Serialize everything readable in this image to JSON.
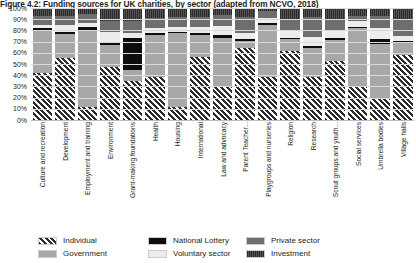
{
  "figure": {
    "title": "Figure 4.2: Funding sources for UK charities, by sector (adapted from NCVO, 2018)"
  },
  "legend": {
    "items": [
      {
        "label": "Individual",
        "key": "individual",
        "color": "#2b2b2b",
        "swatch": "hatch-diagonal"
      },
      {
        "label": "Government",
        "key": "government",
        "color": "#a8a8a8",
        "swatch": "solid"
      },
      {
        "label": "National Lottery",
        "key": "lottery",
        "color": "#0d0d0d",
        "swatch": "solid"
      },
      {
        "label": "Voluntary sector",
        "key": "voluntary",
        "color": "#ececec",
        "swatch": "solid"
      },
      {
        "label": "Private sector",
        "key": "private",
        "color": "#6e6e6e",
        "swatch": "solid"
      },
      {
        "label": "Investment",
        "key": "investment",
        "color": "#3f3f3f",
        "swatch": "texture-vertical"
      }
    ]
  },
  "chart_data": {
    "type": "bar",
    "subtype": "stacked-100-percent",
    "title": "Figure 4.2: Funding sources for UK charities, by sector (adapted from NCVO, 2018)",
    "xlabel": "",
    "ylabel": "",
    "ylim": [
      0,
      100
    ],
    "ytick_labels": [
      "0%",
      "10%",
      "20%",
      "30%",
      "40%",
      "50%",
      "60%",
      "70%",
      "80%",
      "90%",
      "100%"
    ],
    "ytick_values": [
      0,
      10,
      20,
      30,
      40,
      50,
      60,
      70,
      80,
      90,
      100
    ],
    "grid": true,
    "legend_position": "bottom",
    "stack_order": [
      "Individual",
      "Government",
      "National Lottery",
      "Voluntary sector",
      "Private sector",
      "Investment"
    ],
    "categories": [
      "Culture and recreation",
      "Development",
      "Employment and training",
      "Environment",
      "Grant-making foundations",
      "Health",
      "Housing",
      "International",
      "Law and advocacy",
      "Parent Teacher...",
      "Playgroups and nurseries",
      "Religion",
      "Research",
      "Scout groups and youth...",
      "Social services",
      "Umbrella bodies",
      "Village halls"
    ],
    "series": [
      {
        "name": "Individual",
        "values": [
          42,
          55,
          12,
          47,
          35,
          38,
          12,
          56,
          30,
          64,
          38,
          62,
          38,
          53,
          30,
          20,
          58
        ]
      },
      {
        "name": "Government",
        "values": [
          38,
          22,
          68,
          20,
          10,
          38,
          66,
          20,
          43,
          7,
          47,
          10,
          26,
          18,
          52,
          48,
          12
        ]
      },
      {
        "name": "National Lottery",
        "values": [
          2,
          2,
          3,
          2,
          28,
          2,
          1,
          2,
          3,
          1,
          2,
          1,
          2,
          2,
          1,
          4,
          1
        ]
      },
      {
        "name": "Voluntary sector",
        "values": [
          3,
          6,
          4,
          10,
          5,
          4,
          4,
          5,
          8,
          6,
          4,
          7,
          8,
          7,
          5,
          10,
          4
        ]
      },
      {
        "name": "Private sector",
        "values": [
          8,
          8,
          8,
          9,
          10,
          9,
          9,
          9,
          10,
          14,
          6,
          10,
          18,
          9,
          5,
          11,
          14
        ]
      },
      {
        "name": "Investment",
        "values": [
          7,
          7,
          5,
          12,
          12,
          9,
          8,
          8,
          6,
          8,
          3,
          10,
          8,
          11,
          7,
          7,
          11
        ]
      }
    ]
  }
}
